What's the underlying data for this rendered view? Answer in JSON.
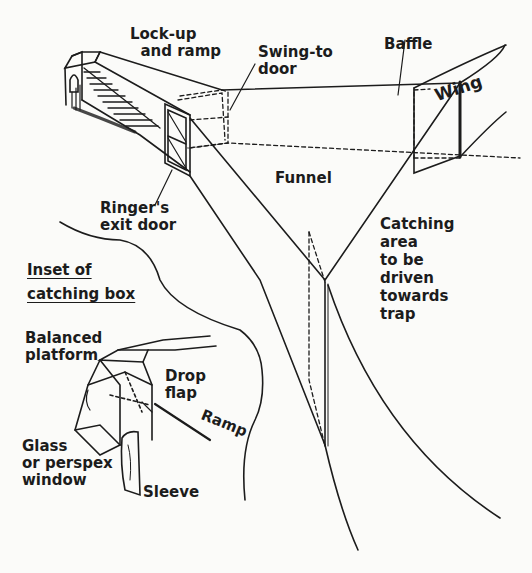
{
  "diagram": {
    "labels": {
      "lockup": "Lock-up\n  and ramp",
      "swing_door": "Swing-to\ndoor",
      "baffle": "Baffle",
      "wing": "Wing",
      "funnel": "Funnel",
      "ringer_door": "Ringer's\nexit door",
      "catching_area": "Catching\narea\nto be\ndriven\ntowards\ntrap",
      "inset_title_1": "Inset of",
      "inset_title_2": "catching box",
      "balanced_platform": "Balanced\nplatform",
      "drop_flap": "Drop\nflap",
      "ramp": "Ramp",
      "glass_window": "Glass\nor perspex\nwindow",
      "sleeve": "Sleeve"
    },
    "colors": {
      "ink": "#1c1c1c",
      "paper": "#fbfbf9"
    }
  }
}
